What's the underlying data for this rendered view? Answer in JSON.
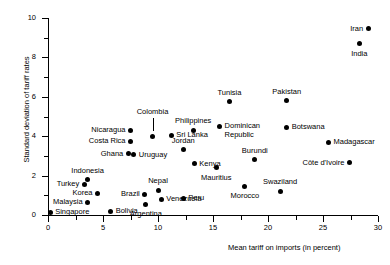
{
  "chart_data": {
    "type": "scatter",
    "title": "",
    "xlabel": "Mean tariff on imports (in percent)",
    "ylabel": "Standard deviation of tariff rates",
    "xlim": [
      0,
      30
    ],
    "ylim": [
      0,
      10
    ],
    "xticks": [
      0,
      5,
      10,
      15,
      20,
      25,
      30
    ],
    "yticks": [
      0,
      2,
      4,
      6,
      8,
      10
    ],
    "xtick_labels": [
      "0",
      "5",
      "10",
      "15",
      "20",
      "25",
      "30"
    ],
    "ytick_labels": [
      "0",
      "2",
      "4",
      "6",
      "8",
      "10"
    ],
    "grid": false,
    "legend": "none",
    "points": [
      {
        "label": "Iran",
        "x": 29.1,
        "y": 9.45,
        "label_pos": "left"
      },
      {
        "label": "India",
        "x": 28.3,
        "y": 8.7,
        "label_pos": "below"
      },
      {
        "label": "Tunisia",
        "x": 16.5,
        "y": 5.75,
        "label_pos": "above"
      },
      {
        "label": "Pakistan",
        "x": 21.7,
        "y": 5.8,
        "label_pos": "above"
      },
      {
        "label": "Dominican Republic",
        "x": 15.6,
        "y": 4.5,
        "label_pos": "right"
      },
      {
        "label": "Botswana",
        "x": 21.7,
        "y": 4.45,
        "label_pos": "right"
      },
      {
        "label": "Madagascar",
        "x": 25.5,
        "y": 3.7,
        "label_pos": "right"
      },
      {
        "label": "Colombia",
        "x": 9.5,
        "y": 4.0,
        "label_pos": "leader"
      },
      {
        "label": "Philippines",
        "x": 13.2,
        "y": 4.3,
        "label_pos": "above"
      },
      {
        "label": "Nicaragua",
        "x": 7.5,
        "y": 4.3,
        "label_pos": "left"
      },
      {
        "label": "Sri Lanka",
        "x": 11.2,
        "y": 4.05,
        "label_pos": "right"
      },
      {
        "label": "Costa Rica",
        "x": 7.5,
        "y": 3.75,
        "label_pos": "left"
      },
      {
        "label": "Jordan",
        "x": 12.3,
        "y": 3.3,
        "label_pos": "above"
      },
      {
        "label": "Ghana",
        "x": 7.3,
        "y": 3.1,
        "label_pos": "left"
      },
      {
        "label": "Uruguay",
        "x": 7.8,
        "y": 3.05,
        "label_pos": "right"
      },
      {
        "label": "Kenya",
        "x": 13.3,
        "y": 2.6,
        "label_pos": "right"
      },
      {
        "label": "Burundi",
        "x": 18.8,
        "y": 2.8,
        "label_pos": "above"
      },
      {
        "label": "Côte d'Ivoire",
        "x": 27.4,
        "y": 2.65,
        "label_pos": "left"
      },
      {
        "label": "Mauritius",
        "x": 15.3,
        "y": 2.4,
        "label_pos": "below"
      },
      {
        "label": "Indonesia",
        "x": 3.6,
        "y": 1.8,
        "label_pos": "above"
      },
      {
        "label": "Turkey",
        "x": 3.3,
        "y": 1.55,
        "label_pos": "left"
      },
      {
        "label": "Nepal",
        "x": 10.0,
        "y": 1.25,
        "label_pos": "above"
      },
      {
        "label": "Korea",
        "x": 4.5,
        "y": 1.1,
        "label_pos": "left"
      },
      {
        "label": "Brazil",
        "x": 8.8,
        "y": 1.05,
        "label_pos": "left"
      },
      {
        "label": "Venezuela",
        "x": 10.3,
        "y": 0.8,
        "label_pos": "right"
      },
      {
        "label": "Peru",
        "x": 12.3,
        "y": 0.85,
        "label_pos": "right"
      },
      {
        "label": "Morocco",
        "x": 17.9,
        "y": 1.45,
        "label_pos": "below"
      },
      {
        "label": "Swaziland",
        "x": 21.1,
        "y": 1.2,
        "label_pos": "above"
      },
      {
        "label": "Malaysia",
        "x": 3.6,
        "y": 0.65,
        "label_pos": "left"
      },
      {
        "label": "Argentina",
        "x": 8.9,
        "y": 0.55,
        "label_pos": "below"
      },
      {
        "label": "Singapore",
        "x": 0.2,
        "y": 0.15,
        "label_pos": "right"
      },
      {
        "label": "Bolivia",
        "x": 5.7,
        "y": 0.2,
        "label_pos": "right"
      }
    ]
  }
}
